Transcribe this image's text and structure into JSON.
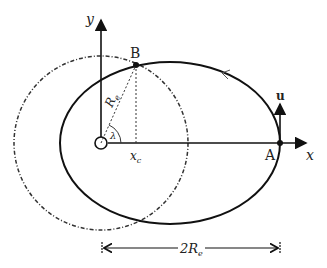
{
  "diagram": {
    "labels": {
      "y_axis": "y",
      "x_axis": "x",
      "point_b": "B",
      "point_a": "A",
      "velocity": "u",
      "radius": "R",
      "radius_sub": "e",
      "angle": "λ",
      "xc": "x",
      "xc_sub": "c",
      "dimension": "2R",
      "dimension_sub": "e"
    },
    "colors": {
      "line": "#111111",
      "dashed": "#444444"
    }
  }
}
